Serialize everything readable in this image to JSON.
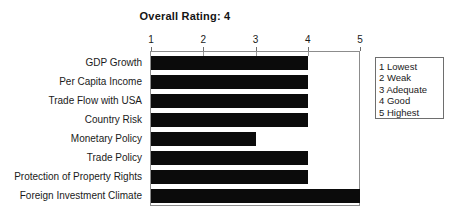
{
  "chart_data": {
    "type": "bar",
    "orientation": "horizontal",
    "title": "Overall Rating: 4",
    "xlabel": "",
    "ylabel": "",
    "xlim": [
      1,
      5
    ],
    "grid": false,
    "xticks": [
      "1",
      "2",
      "3",
      "4",
      "5"
    ],
    "xtick_values": [
      1,
      2,
      3,
      4,
      5
    ],
    "axis_position": "top",
    "categories": [
      "GDP Growth",
      "Per Capita Income",
      "Trade Flow with USA",
      "Country Risk",
      "Monetary Policy",
      "Trade Policy",
      "Protection of Property Rights",
      "Foreign Investment Climate"
    ],
    "values": [
      4,
      4,
      4,
      4,
      3,
      4,
      4,
      5
    ],
    "bar_color": "#0b0b0b",
    "legend": {
      "position": "right",
      "entries": [
        "1 Lowest",
        "2 Weak",
        "3 Adequate",
        "4 Good",
        "5 Highest"
      ]
    }
  }
}
